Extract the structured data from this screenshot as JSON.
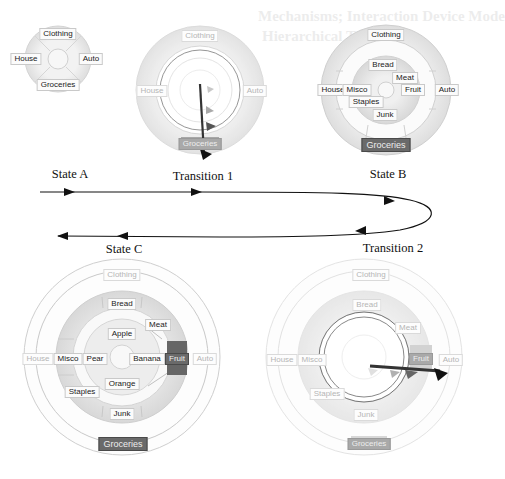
{
  "ghost_text": {
    "line1": "Mechanisms; Interaction Device Mode",
    "line2": "Hierarchical Transitions"
  },
  "colors": {
    "ring_light": "#ececec",
    "ring_mid": "#dcdcdc",
    "ring_line": "#c4c4c4",
    "selected_fill": "#666666",
    "arrow": "#111111"
  },
  "states": {
    "state_a": {
      "caption": "State A",
      "labels": {
        "clothing": "Clothing",
        "house": "House",
        "auto": "Auto",
        "groceries": "Groceries"
      }
    },
    "transition_1": {
      "caption": "Transition 1",
      "labels": {
        "clothing": "Clothing",
        "house": "House",
        "auto": "Auto",
        "groceries": "Groceries"
      }
    },
    "state_b": {
      "caption": "State B",
      "labels": {
        "clothing": "Clothing",
        "house": "House",
        "auto": "Auto",
        "groceries": "Groceries",
        "bread": "Bread",
        "meat": "Meat",
        "misco": "Misco",
        "fruit": "Fruit",
        "staples": "Staples",
        "junk": "Junk"
      }
    },
    "transition_2": {
      "caption": "Transition 2",
      "labels": {
        "clothing": "Clothing",
        "house": "House",
        "auto": "Auto",
        "groceries": "Groceries",
        "bread": "Bread",
        "meat": "Meat",
        "misco": "Misco",
        "fruit": "Fruit",
        "staples": "Staples",
        "junk": "Junk"
      }
    },
    "state_c": {
      "caption": "State C",
      "labels": {
        "clothing": "Clothing",
        "house": "House",
        "auto": "Auto",
        "groceries": "Groceries",
        "bread": "Bread",
        "meat": "Meat",
        "misco": "Misco",
        "fruit": "Fruit",
        "staples": "Staples",
        "junk": "Junk",
        "apple": "Apple",
        "pear": "Pear",
        "banana": "Banana",
        "orange": "Orange"
      }
    }
  },
  "flow": {
    "sequence": [
      "State A",
      "Transition 1",
      "State B",
      "Transition 2",
      "State C"
    ]
  }
}
